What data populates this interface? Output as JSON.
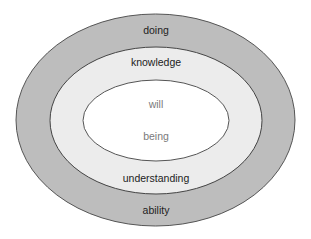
{
  "diagram": {
    "type": "nested-ellipses",
    "colors": {
      "outer_fill": "#bdbdbd",
      "middle_fill": "#ececec",
      "inner_fill": "#ffffff",
      "stroke": "#555555",
      "text_dark": "#222222",
      "text_light": "#7a7a7a"
    },
    "layers": [
      {
        "name": "outer",
        "top_label": "doing",
        "bottom_label": "ability"
      },
      {
        "name": "middle",
        "top_label": "knowledge",
        "bottom_label": "understanding"
      },
      {
        "name": "inner",
        "top_label": "will",
        "bottom_label": "being"
      }
    ]
  }
}
